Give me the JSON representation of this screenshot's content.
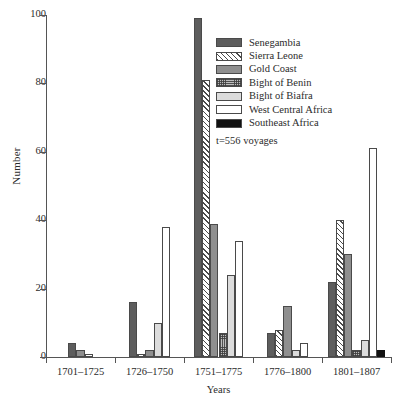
{
  "chart_data": {
    "type": "bar",
    "title": "",
    "xlabel": "Years",
    "ylabel": "Number",
    "ylim": [
      0,
      100
    ],
    "yticks": [
      0,
      20,
      40,
      60,
      80,
      100
    ],
    "grid": false,
    "legend_position": "top-right",
    "annotation": "t=556 voyages",
    "categories": [
      "1701–1725",
      "1726–1750",
      "1751–1775",
      "1776–1800",
      "1801–1807"
    ],
    "series": [
      {
        "name": "Senegambia",
        "values": [
          4,
          16,
          99,
          7,
          22
        ],
        "color": "#5d5d5d",
        "pattern": "solid-dark-gray"
      },
      {
        "name": "Sierra Leone",
        "values": [
          0,
          1,
          81,
          8,
          40
        ],
        "color": "#ffffff",
        "pattern": "diagonal-hatch"
      },
      {
        "name": "Gold Coast",
        "values": [
          2,
          2,
          39,
          15,
          30
        ],
        "color": "#8f8f8f",
        "pattern": "solid-mid-gray"
      },
      {
        "name": "Bight of Benin",
        "values": [
          0,
          0,
          7,
          0,
          2
        ],
        "color": "#bdbdbd",
        "pattern": "stipple"
      },
      {
        "name": "Bight of Biafra",
        "values": [
          0,
          10,
          24,
          2,
          5
        ],
        "color": "#dcdcdc",
        "pattern": "solid-light-gray"
      },
      {
        "name": "West Central Africa",
        "values": [
          1,
          38,
          34,
          4,
          61
        ],
        "color": "#ffffff",
        "pattern": "empty"
      },
      {
        "name": "Southeast Africa",
        "values": [
          0,
          0,
          0,
          0,
          2
        ],
        "color": "#111111",
        "pattern": "solid-black"
      }
    ]
  }
}
